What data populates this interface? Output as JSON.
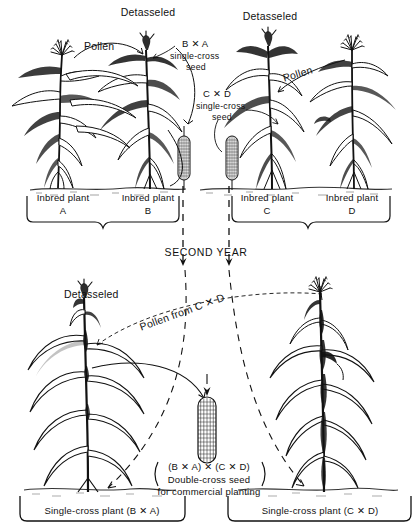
{
  "figure": {
    "type": "process-diagram",
    "ink_color": "#111111",
    "background_color": "#ffffff"
  },
  "first_year": {
    "panel_left": {
      "detasseled_label": "Detasseled",
      "pollen_label": "Pollen",
      "seed_callout": {
        "line1": "B ✕ A",
        "line2": "single-cross",
        "line3": "seed"
      },
      "plants": [
        {
          "caption": "Inbred plant",
          "letter": "A"
        },
        {
          "caption": "Inbred plant",
          "letter": "B"
        }
      ]
    },
    "panel_right": {
      "detasseled_label": "Detasseled",
      "pollen_label": "Pollen",
      "seed_callout": {
        "line1": "C ✕ D",
        "line2": "single-cross",
        "line3": "seed"
      },
      "plants": [
        {
          "caption": "Inbred plant",
          "letter": "C"
        },
        {
          "caption": "Inbred plant",
          "letter": "D"
        }
      ]
    }
  },
  "transition": {
    "label": "SECOND  YEAR"
  },
  "second_year": {
    "detasseled_label": "Detasseled",
    "pollen_label": "Pollen from C ✕ D",
    "seed_callout": {
      "line1": "(B ✕ A) ✕ (C ✕ D)",
      "line2": "Double-cross seed",
      "line3": "for commercial planting"
    },
    "plants": [
      {
        "caption": "Single-cross plant (B ✕ A)"
      },
      {
        "caption": "Single-cross plant (C ✕ D)"
      }
    ]
  }
}
